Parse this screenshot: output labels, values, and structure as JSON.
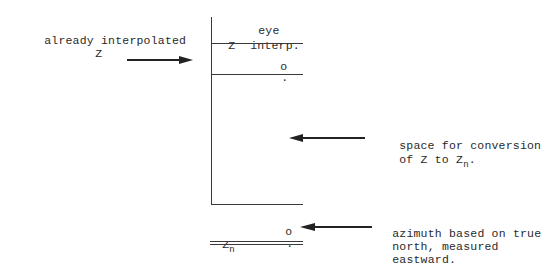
{
  "diagram": {
    "left_annotation": {
      "line1": "already interpolated",
      "line2": "Z"
    },
    "table_header": {
      "col2_top": "eye",
      "col1": "Z",
      "col2_bottom": "interp."
    },
    "first_row": {
      "degree_mark": "o",
      "decimal_mark": "."
    },
    "middle_annotation": {
      "line1": "space for conversion",
      "line2_prefix": "of Z to Z",
      "line2_sub": "n",
      "line2_suffix": "."
    },
    "result_row": {
      "label": "Z",
      "label_sub": "n",
      "degree_mark": "o",
      "decimal_mark": "."
    },
    "bottom_annotation": {
      "line1": "azimuth based on true",
      "line2": "north, measured",
      "line3": "eastward."
    },
    "arrows": [
      {
        "name": "arrow-to-interpolated-z",
        "direction": "right"
      },
      {
        "name": "arrow-to-conversion-space",
        "direction": "left"
      },
      {
        "name": "arrow-to-zn",
        "direction": "left"
      }
    ]
  }
}
